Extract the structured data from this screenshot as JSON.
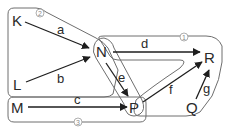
{
  "diagram": {
    "nodes": {
      "K": "K",
      "L": "L",
      "M": "M",
      "N": "N",
      "P": "P",
      "Q": "Q",
      "R": "R"
    },
    "edges": [
      {
        "label": "a",
        "from": "K",
        "to": "N"
      },
      {
        "label": "b",
        "from": "L",
        "to": "N"
      },
      {
        "label": "c",
        "from": "M",
        "to": "P"
      },
      {
        "label": "d",
        "from": "N",
        "to": "R"
      },
      {
        "label": "e",
        "from": "N",
        "to": "P"
      },
      {
        "label": "f",
        "from": "P",
        "to": "R"
      },
      {
        "label": "g",
        "from": "Q",
        "to": "R"
      }
    ],
    "regions": [
      {
        "number": "1",
        "contains": [
          "N",
          "P",
          "Q",
          "R"
        ]
      },
      {
        "number": "2",
        "contains": [
          "K",
          "L",
          "N",
          "P"
        ]
      },
      {
        "number": "3",
        "contains": [
          "M",
          "P"
        ]
      }
    ],
    "colors": {
      "edge": "#1e1e1e",
      "region_outline": "#6e6e6e",
      "text": "#2a2a2a"
    }
  }
}
